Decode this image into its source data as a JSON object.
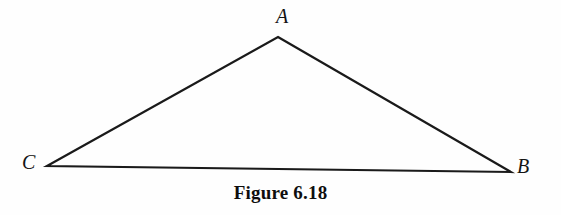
{
  "figure": {
    "caption": "Figure 6.18",
    "background_color": "#fefefe",
    "stroke_color": "#1a1a1a",
    "text_color": "#141414",
    "canvas": {
      "width": 561,
      "height": 215
    }
  },
  "labels": {
    "apex": "A",
    "bottom_left": "C",
    "bottom_right": "B"
  },
  "chart_data": {
    "type": "diagram",
    "title": "Figure 6.18",
    "shape": "triangle",
    "stroke_width": 2.2,
    "points": [
      {
        "name": "A",
        "label": "A",
        "x": 278,
        "y": 37,
        "label_x": 282,
        "label_y": 18
      },
      {
        "name": "C",
        "label": "C",
        "x": 47,
        "y": 166,
        "label_x": 28,
        "label_y": 164
      },
      {
        "name": "B",
        "label": "B",
        "x": 511,
        "y": 172,
        "label_x": 523,
        "label_y": 168
      }
    ],
    "edges": [
      {
        "from": "C",
        "to": "A"
      },
      {
        "from": "A",
        "to": "B"
      },
      {
        "from": "C",
        "to": "B"
      }
    ],
    "xlabel": "",
    "ylabel": "",
    "grid": false,
    "legend": false
  }
}
